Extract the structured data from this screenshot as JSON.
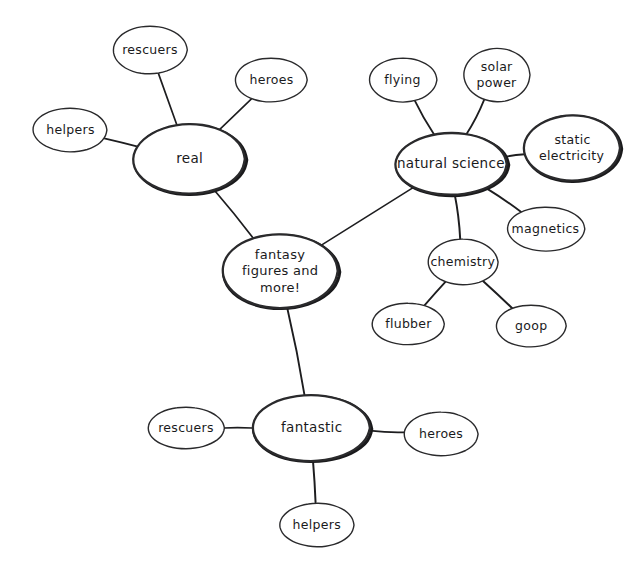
{
  "diagram": {
    "background_color": "#ffffff",
    "ink_color": "#1d1d1f",
    "style": "hand-drawn concept map",
    "nodes": {
      "center": {
        "label": "fantasy figures and more!",
        "lines": [
          "fantasy",
          "figures and",
          "more!"
        ]
      },
      "real": {
        "label": "real"
      },
      "real_rescuers": {
        "label": "rescuers"
      },
      "real_heroes": {
        "label": "heroes"
      },
      "real_helpers": {
        "label": "helpers"
      },
      "natural_science": {
        "label": "natural science"
      },
      "flying": {
        "label": "flying"
      },
      "solar_power": {
        "label": "solar power",
        "lines": [
          "solar",
          "power"
        ]
      },
      "static_electricity": {
        "label": "static electricity",
        "lines": [
          "static",
          "electricity"
        ]
      },
      "magnetics": {
        "label": "magnetics"
      },
      "chemistry": {
        "label": "chemistry"
      },
      "flubber": {
        "label": "flubber"
      },
      "goop": {
        "label": "goop"
      },
      "fantastic": {
        "label": "fantastic"
      },
      "fantastic_rescuers": {
        "label": "rescuers"
      },
      "fantastic_heroes": {
        "label": "heroes"
      },
      "fantastic_helpers": {
        "label": "helpers"
      }
    }
  },
  "chart_data": {
    "type": "diagram",
    "subtype": "mind-map",
    "root": "fantasy figures and more!",
    "nodes": [
      {
        "id": "center",
        "label": "fantasy figures and more!",
        "cx": 280,
        "cy": 271,
        "rx": 58,
        "ry": 37,
        "emphasis": "heavy",
        "depth": 0
      },
      {
        "id": "real",
        "label": "real",
        "cx": 189,
        "cy": 159,
        "rx": 56,
        "ry": 35,
        "emphasis": "heavy",
        "depth": 1
      },
      {
        "id": "real_rescuers",
        "label": "rescuers",
        "cx": 150,
        "cy": 50,
        "rx": 37,
        "ry": 24,
        "emphasis": "light",
        "depth": 2
      },
      {
        "id": "real_heroes",
        "label": "heroes",
        "cx": 271,
        "cy": 80,
        "rx": 36,
        "ry": 22,
        "emphasis": "light",
        "depth": 2
      },
      {
        "id": "real_helpers",
        "label": "helpers",
        "cx": 70,
        "cy": 130,
        "rx": 37,
        "ry": 22,
        "emphasis": "light",
        "depth": 2
      },
      {
        "id": "natural_science",
        "label": "natural science",
        "cx": 451,
        "cy": 164,
        "rx": 56,
        "ry": 31,
        "emphasis": "heavy",
        "depth": 1
      },
      {
        "id": "flying",
        "label": "flying",
        "cx": 403,
        "cy": 80,
        "rx": 34,
        "ry": 22,
        "emphasis": "light",
        "depth": 2
      },
      {
        "id": "solar_power",
        "label": "solar power",
        "cx": 497,
        "cy": 75,
        "rx": 33,
        "ry": 27,
        "emphasis": "light",
        "depth": 2
      },
      {
        "id": "static_electricity",
        "label": "static electricity",
        "cx": 572,
        "cy": 148,
        "rx": 48,
        "ry": 33,
        "emphasis": "heavy",
        "depth": 2
      },
      {
        "id": "magnetics",
        "label": "magnetics",
        "cx": 546,
        "cy": 229,
        "rx": 39,
        "ry": 22,
        "emphasis": "light",
        "depth": 2
      },
      {
        "id": "chemistry",
        "label": "chemistry",
        "cx": 463,
        "cy": 262,
        "rx": 35,
        "ry": 23,
        "emphasis": "light",
        "depth": 2
      },
      {
        "id": "flubber",
        "label": "flubber",
        "cx": 408,
        "cy": 324,
        "rx": 36,
        "ry": 21,
        "emphasis": "light",
        "depth": 3
      },
      {
        "id": "goop",
        "label": "goop",
        "cx": 531,
        "cy": 326,
        "rx": 35,
        "ry": 21,
        "emphasis": "light",
        "depth": 3
      },
      {
        "id": "fantastic",
        "label": "fantastic",
        "cx": 311,
        "cy": 428,
        "rx": 59,
        "ry": 33,
        "emphasis": "heavy",
        "depth": 1
      },
      {
        "id": "fantastic_rescuers",
        "label": "rescuers",
        "cx": 186,
        "cy": 428,
        "rx": 38,
        "ry": 21,
        "emphasis": "light",
        "depth": 2
      },
      {
        "id": "fantastic_heroes",
        "label": "heroes",
        "cx": 441,
        "cy": 434,
        "rx": 37,
        "ry": 22,
        "emphasis": "light",
        "depth": 2
      },
      {
        "id": "fantastic_helpers",
        "label": "helpers",
        "cx": 317,
        "cy": 525,
        "rx": 37,
        "ry": 22,
        "emphasis": "light",
        "depth": 2
      }
    ],
    "edges": [
      {
        "from": "center",
        "to": "real"
      },
      {
        "from": "center",
        "to": "natural_science"
      },
      {
        "from": "center",
        "to": "fantastic"
      },
      {
        "from": "real",
        "to": "real_rescuers"
      },
      {
        "from": "real",
        "to": "real_heroes"
      },
      {
        "from": "real",
        "to": "real_helpers"
      },
      {
        "from": "natural_science",
        "to": "flying"
      },
      {
        "from": "natural_science",
        "to": "solar_power"
      },
      {
        "from": "natural_science",
        "to": "static_electricity"
      },
      {
        "from": "natural_science",
        "to": "magnetics"
      },
      {
        "from": "natural_science",
        "to": "chemistry"
      },
      {
        "from": "chemistry",
        "to": "flubber"
      },
      {
        "from": "chemistry",
        "to": "goop"
      },
      {
        "from": "fantastic",
        "to": "fantastic_rescuers"
      },
      {
        "from": "fantastic",
        "to": "fantastic_heroes"
      },
      {
        "from": "fantastic",
        "to": "fantastic_helpers"
      }
    ]
  }
}
